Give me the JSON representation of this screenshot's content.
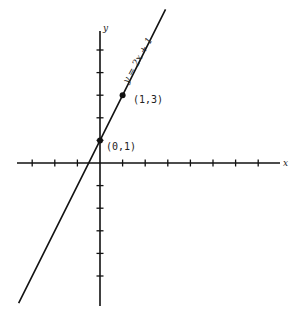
{
  "chart_data": {
    "type": "line",
    "title": "",
    "xlabel": "x",
    "ylabel": "y",
    "xlim": [
      -4,
      8
    ],
    "ylim": [
      -6,
      6
    ],
    "grid": false,
    "x_ticks": [
      -3,
      -2,
      -1,
      1,
      2,
      3,
      4,
      5,
      6,
      7
    ],
    "y_ticks": [
      -5,
      -4,
      -3,
      -2,
      -1,
      1,
      2,
      3,
      4,
      5
    ],
    "tick_labels_shown": false,
    "series": [
      {
        "name": "y = 2x + 1",
        "equation": "y = 2x + 1",
        "x": [
          -3.6,
          2.9
        ],
        "y": [
          -6.2,
          6.8
        ]
      }
    ],
    "points": [
      {
        "label": "(0,1)",
        "x": 0,
        "y": 1
      },
      {
        "label": "(1,3)",
        "x": 1,
        "y": 3
      }
    ],
    "annotations": [
      "y = 2x + 1",
      "(0,1)",
      "(1,3)"
    ]
  },
  "labels": {
    "x_axis": "x",
    "y_axis": "y",
    "equation": "y = 2x + 1",
    "point_a": "(0,1)",
    "point_b": "(1,3)"
  }
}
